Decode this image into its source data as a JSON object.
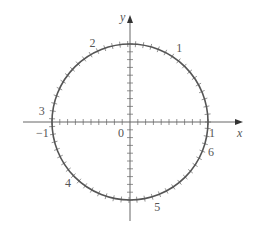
{
  "figure": {
    "colors": {
      "background": "#ffffff",
      "circle": "#555555",
      "axes": "#666666",
      "labels": "#555555"
    },
    "geometry": {
      "center": [
        130,
        122
      ],
      "radius": 78,
      "x_axis": [
        23,
        243
      ],
      "y_axis": [
        221,
        15
      ],
      "axis_tick_step": 0.1,
      "circle_tick_step_rad": 0.1
    },
    "axis_labels": {
      "x": "x",
      "y": "y",
      "origin": "0",
      "x_neg_one": "−1",
      "x_pos_one": "1"
    },
    "arc_labels": [
      {
        "text": "1",
        "angle": 1
      },
      {
        "text": "2",
        "angle": 2
      },
      {
        "text": "3",
        "angle": 3
      },
      {
        "text": "4",
        "angle": 4
      },
      {
        "text": "5",
        "angle": 5
      },
      {
        "text": "6",
        "angle": 6
      }
    ]
  }
}
